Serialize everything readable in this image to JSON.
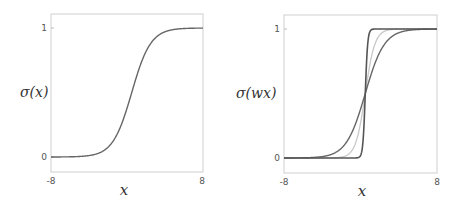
{
  "chart_data": [
    {
      "type": "line",
      "title": "",
      "xlabel": "x",
      "ylabel": "σ(x)",
      "xlim": [
        -8,
        8
      ],
      "ylim": [
        0,
        1
      ],
      "x_ticks": [
        "-8",
        "8"
      ],
      "y_ticks": [
        "0",
        "1"
      ],
      "grid": false,
      "series": [
        {
          "name": "sigmoid w=1",
          "w": 1,
          "color": "#666666",
          "x": [
            -8,
            -6,
            -4,
            -2,
            -1,
            0,
            1,
            2,
            4,
            6,
            8
          ],
          "values": [
            0.0003,
            0.0025,
            0.018,
            0.119,
            0.269,
            0.5,
            0.731,
            0.881,
            0.982,
            0.9975,
            0.9997
          ]
        }
      ]
    },
    {
      "type": "line",
      "title": "",
      "xlabel": "x",
      "ylabel": "σ(wx)",
      "xlim": [
        -8,
        8
      ],
      "ylim": [
        0,
        1
      ],
      "x_ticks": [
        "-8",
        "8"
      ],
      "y_ticks": [
        "0",
        "1"
      ],
      "grid": false,
      "series": [
        {
          "name": "w=1",
          "w": 1,
          "color": "#666666",
          "x": [
            -8,
            -4,
            -2,
            0,
            2,
            4,
            8
          ],
          "values": [
            0.0003,
            0.018,
            0.119,
            0.5,
            0.881,
            0.982,
            0.9997
          ]
        },
        {
          "name": "w=2",
          "w": 2,
          "color": "#c8c8c8",
          "x": [
            -8,
            -2,
            -1,
            0,
            1,
            2,
            8
          ],
          "values": [
            0.0,
            0.018,
            0.119,
            0.5,
            0.881,
            0.982,
            1.0
          ]
        },
        {
          "name": "w=8",
          "w": 8,
          "color": "#555555",
          "x": [
            -8,
            -0.5,
            -0.25,
            0,
            0.25,
            0.5,
            8
          ],
          "values": [
            0.0,
            0.018,
            0.119,
            0.5,
            0.881,
            0.982,
            1.0
          ]
        }
      ]
    }
  ],
  "left": {
    "ylabel": "σ(x)",
    "xlabel": "x",
    "ytick_top": "1",
    "ytick_bottom": "0",
    "xtick_left": "-8",
    "xtick_right": "8"
  },
  "right": {
    "ylabel": "σ(wx)",
    "xlabel": "x",
    "ytick_top": "1",
    "ytick_bottom": "0",
    "xtick_left": "-8",
    "xtick_right": "8"
  }
}
